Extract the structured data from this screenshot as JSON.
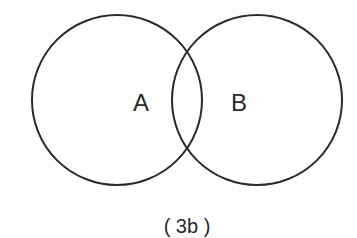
{
  "diagram": {
    "type": "venn",
    "sets": [
      {
        "label": "A"
      },
      {
        "label": "B"
      }
    ],
    "caption": "( 3b )",
    "colors": {
      "stroke": "#2a2a2a",
      "background": "#ffffff"
    }
  }
}
